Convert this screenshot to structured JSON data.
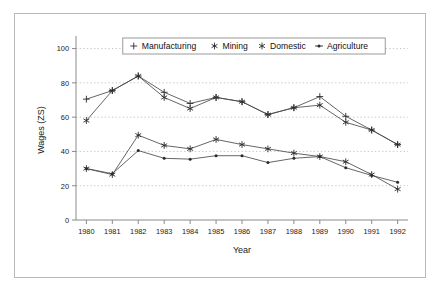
{
  "chart_data": {
    "type": "line",
    "title": "",
    "xlabel": "Year",
    "ylabel": "Wages (ZS)",
    "x": [
      1980,
      1981,
      1982,
      1983,
      1984,
      1985,
      1986,
      1987,
      1988,
      1989,
      1990,
      1991,
      1992
    ],
    "xtick_labels": [
      "1980",
      "1981",
      "1982",
      "1983",
      "1984",
      "1985",
      "1986",
      "1987",
      "1988",
      "1989",
      "1990",
      "1991",
      "1992"
    ],
    "ytick_labels": [
      "0",
      "20",
      "40",
      "60",
      "80",
      "100"
    ],
    "yticks": [
      0,
      20,
      40,
      60,
      80,
      100
    ],
    "ylim": [
      0,
      105
    ],
    "xlim": [
      1979.6,
      1992.4
    ],
    "grid": "horizontal-dotted",
    "legend_position": "top-center",
    "series": [
      {
        "name": "Manufacturing",
        "marker": "plus",
        "values": [
          70.5,
          75.5,
          84.0,
          74.5,
          68.0,
          71.5,
          69.0,
          61.5,
          65.5,
          72.0,
          60.5,
          52.5,
          44.0
        ]
      },
      {
        "name": "Mining",
        "marker": "star6",
        "values": [
          58.0,
          75.5,
          84.0,
          71.5,
          65.0,
          71.5,
          69.0,
          61.5,
          65.5,
          67.0,
          57.0,
          52.5,
          44.0
        ]
      },
      {
        "name": "Domestic",
        "marker": "star6",
        "values": [
          30.0,
          26.5,
          49.5,
          43.5,
          41.5,
          47.0,
          44.0,
          41.5,
          39.0,
          37.0,
          34.0,
          26.5,
          18.0
        ]
      },
      {
        "name": "Agriculture",
        "marker": "dot",
        "values": [
          30.0,
          27.0,
          40.5,
          36.0,
          35.5,
          37.5,
          37.5,
          33.5,
          36.0,
          37.0,
          30.5,
          26.0,
          22.0
        ]
      }
    ]
  },
  "legend": {
    "entries": [
      {
        "label": "Manufacturing",
        "marker": "plus-icon"
      },
      {
        "label": "Mining",
        "marker": "star6-icon"
      },
      {
        "label": "Domestic",
        "marker": "star6-icon"
      },
      {
        "label": "Agriculture",
        "marker": "dot-icon"
      }
    ]
  },
  "colors": {
    "line": "#4a4a4a",
    "marker": "#2a2a2a",
    "grid": "#c9c9c9",
    "axis": "#8a8a8a",
    "frame": "#b9b9b9",
    "background": "#ffffff"
  }
}
